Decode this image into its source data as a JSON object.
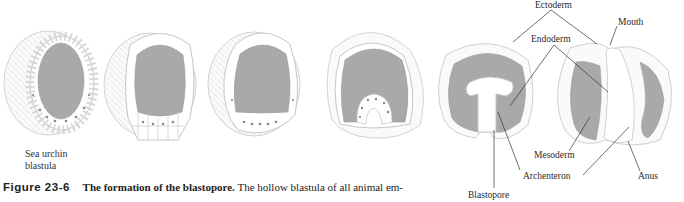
{
  "figure": {
    "number": "Figure 23-6",
    "title": "The formation of the blastopore.",
    "caption_text": "The hollow blastula of all animal em-"
  },
  "stages": [
    {
      "id": "stage-1",
      "label": "Sea urchin blastula"
    },
    {
      "id": "stage-2",
      "label": ""
    },
    {
      "id": "stage-3",
      "label": ""
    },
    {
      "id": "stage-4",
      "label": ""
    },
    {
      "id": "stage-5",
      "label": ""
    },
    {
      "id": "stage-6",
      "label": ""
    }
  ],
  "labels": {
    "sea_urchin_line1": "Sea urchin",
    "sea_urchin_line2": "blastula",
    "ectoderm": "Ectoderm",
    "endoderm": "Endoderm",
    "mouth": "Mouth",
    "mesoderm": "Mesoderm",
    "archenteron": "Archenteron",
    "anus": "Anus",
    "blastopore": "Blastopore"
  },
  "colors": {
    "blastocoel": "#a9a9a9",
    "cell_fill": "#ffffff",
    "outline": "#c8c8c8",
    "leader_line": "#333333"
  }
}
